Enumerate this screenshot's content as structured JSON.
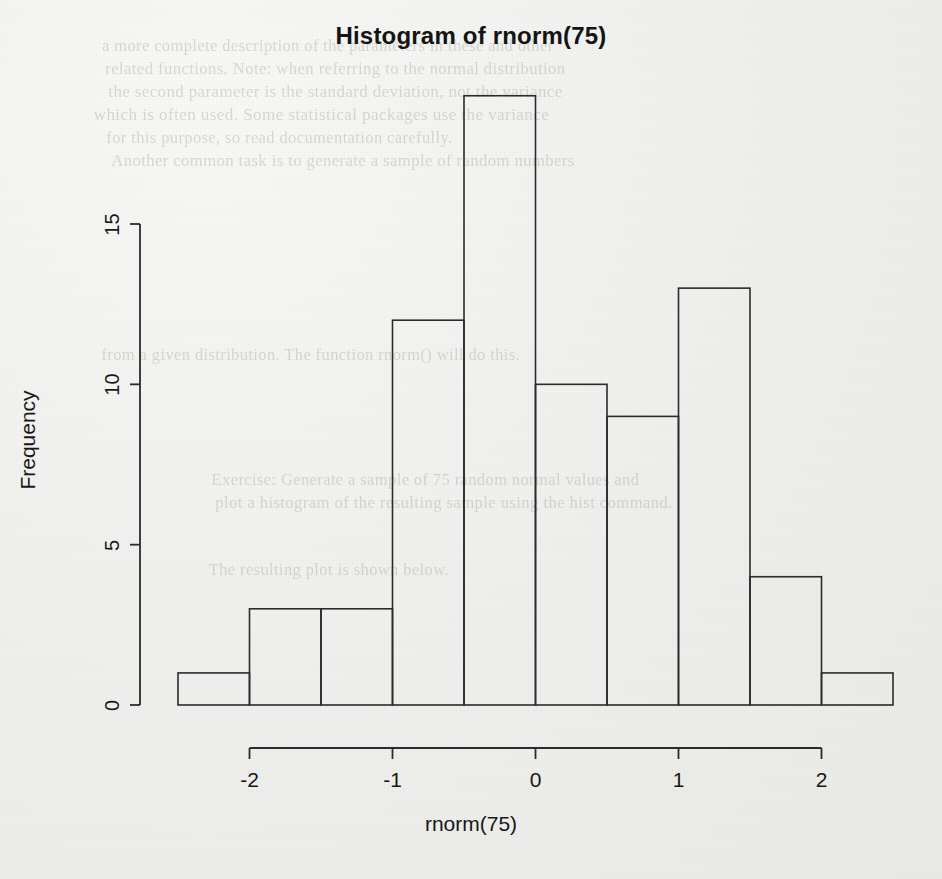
{
  "chart_data": {
    "type": "bar",
    "subtype": "histogram",
    "title": "Histogram of rnorm(75)",
    "xlabel": "rnorm(75)",
    "ylabel": "Frequency",
    "bin_edges": [
      -2.5,
      -2.0,
      -1.5,
      -1.0,
      -0.5,
      0.0,
      0.5,
      1.0,
      1.5,
      2.0,
      2.5
    ],
    "bin_width": 0.5,
    "categories": [
      "[-2.5,-2)",
      "[-2,-1.5)",
      "[-1.5,-1)",
      "[-1,-0.5)",
      "[-0.5,0)",
      "[0,0.5)",
      "[0.5,1)",
      "[1,1.5)",
      "[1.5,2)",
      "[2,2.5)"
    ],
    "values": [
      1,
      3,
      3,
      12,
      19,
      10,
      9,
      13,
      4,
      1
    ],
    "x_tick_values": [
      -2,
      -1,
      0,
      1,
      2
    ],
    "x_tick_labels": [
      "-2",
      "-1",
      "0",
      "1",
      "2"
    ],
    "y_tick_values": [
      0,
      5,
      10,
      15
    ],
    "y_tick_labels": [
      "0",
      "5",
      "10",
      "15"
    ],
    "xlim": [
      -2.5,
      2.5
    ],
    "ylim": [
      0,
      19
    ],
    "grid": false,
    "legend": null,
    "bar_fill": "#00000000",
    "bar_stroke": "#2b2b2b",
    "axis_color": "#2b2b2b",
    "background": "#eeeeec"
  },
  "plot": {
    "title": "Histogram of rnorm(75)",
    "xlabel": "rnorm(75)",
    "ylabel": "Frequency"
  },
  "background_ghost_text": {
    "lines": [
      "a more complete description of the parameters in these and other",
      "related functions. Note: when referring to the normal distribution",
      "the second parameter is the standard deviation, not the variance",
      "which is often used. Some statistical packages use the variance",
      "for this purpose, so read documentation carefully.",
      "Another common task is to generate a sample of random numbers",
      "from a given distribution. The function rnorm() will do this.",
      "Exercise: Generate a sample of 75 random normal values and",
      "plot a histogram of the resulting sample using the hist command.",
      "The resulting plot is shown below."
    ]
  }
}
